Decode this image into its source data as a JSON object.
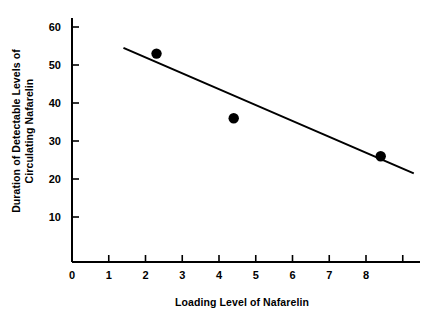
{
  "chart_data": {
    "type": "scatter",
    "title": "",
    "xlabel": "Loading Level of Nafarelin",
    "ylabel_line1": "Duration of Detectable Levels of",
    "ylabel_line2": "Circulating Nafarelin",
    "x": [
      2.3,
      4.4,
      8.4
    ],
    "values": [
      53,
      36,
      26
    ],
    "points": [
      {
        "x": 2.3,
        "y": 53
      },
      {
        "x": 4.4,
        "y": 36
      },
      {
        "x": 8.4,
        "y": 26
      }
    ],
    "series": [
      {
        "name": "Observed durations",
        "x": [
          2.3,
          4.4,
          8.4
        ],
        "values": [
          53,
          36,
          26
        ],
        "marker": "filled-circle",
        "color": "#000000"
      },
      {
        "name": "Fitted trend line",
        "type": "line",
        "x": [
          1.4,
          9.3
        ],
        "values": [
          54.5,
          21.5
        ],
        "color": "#000000"
      }
    ],
    "xlim": [
      0,
      9.6
    ],
    "ylim": [
      0,
      64
    ],
    "xticks": [
      0,
      1,
      2,
      3,
      4,
      5,
      6,
      7,
      8,
      9
    ],
    "xticklabels": [
      "0",
      "1",
      "2",
      "3",
      "4",
      "5",
      "6",
      "7",
      "8",
      ""
    ],
    "yticks": [
      10,
      20,
      30,
      40,
      50,
      60
    ],
    "yticklabels": [
      "10",
      "20",
      "30",
      "40",
      "50",
      "60"
    ],
    "grid": false,
    "legend": "none",
    "axis_color": "#000000",
    "background": "#ffffff"
  }
}
